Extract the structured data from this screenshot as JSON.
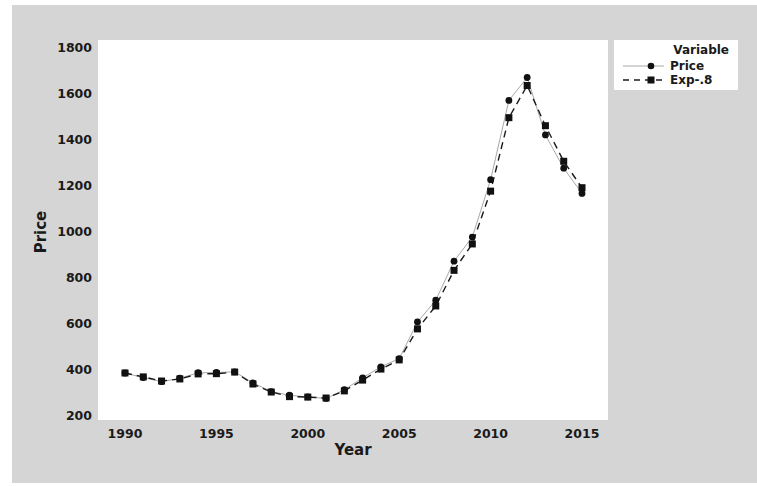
{
  "chart_data": {
    "type": "line",
    "title": "",
    "xlabel": "Year",
    "ylabel": "Price",
    "xlim": [
      1989,
      2016
    ],
    "ylim": [
      200,
      1800
    ],
    "xticks": [
      1990,
      1995,
      2000,
      2005,
      2010,
      2015
    ],
    "yticks": [
      200,
      400,
      600,
      800,
      1000,
      1200,
      1400,
      1600,
      1800
    ],
    "grid": false,
    "legend": {
      "title": "Variable",
      "position": "top-right-outside"
    },
    "x": [
      1990,
      1991,
      1992,
      1993,
      1994,
      1995,
      1996,
      1997,
      1998,
      1999,
      2000,
      2001,
      2002,
      2003,
      2004,
      2005,
      2006,
      2007,
      2008,
      2009,
      2010,
      2011,
      2012,
      2013,
      2014,
      2015
    ],
    "series": [
      {
        "name": "Price",
        "marker": "circle",
        "line": "solid-thin-gray",
        "values": [
          383,
          363,
          345,
          360,
          384,
          385,
          388,
          340,
          302,
          286,
          279,
          272,
          310,
          362,
          410,
          445,
          605,
          700,
          870,
          975,
          1225,
          1570,
          1670,
          1420,
          1275,
          1165
        ]
      },
      {
        "name": "Exp-.8",
        "marker": "square",
        "line": "dashed-black",
        "values": [
          383,
          366,
          348,
          357,
          379,
          380,
          387,
          335,
          300,
          280,
          278,
          274,
          305,
          352,
          400,
          440,
          575,
          675,
          830,
          945,
          1175,
          1495,
          1635,
          1460,
          1305,
          1190
        ]
      }
    ]
  },
  "legend": {
    "title": "Variable",
    "items": [
      {
        "label": "Price",
        "icon": "circle-marker-solid-line"
      },
      {
        "label": "Exp-.8",
        "icon": "square-marker-dashed-line"
      }
    ]
  },
  "axes": {
    "xlabel": "Year",
    "ylabel": "Price"
  },
  "colors": {
    "panel_background": "#d5d5d5",
    "plot_background": "#ffffff",
    "series_price_line": "#a8a8a8",
    "series_exp_line": "#1a1a1a",
    "marker": "#111111"
  }
}
